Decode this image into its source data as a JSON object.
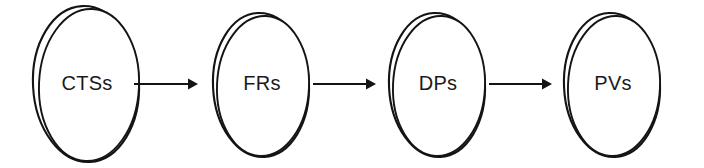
{
  "diagram": {
    "type": "flow-chain",
    "background_color": "#ffffff",
    "stroke_color": "#141414",
    "label_color": "#1a1a1a",
    "nodes": [
      {
        "id": "ctss",
        "label": "CTSs",
        "shape": "double-ellipse",
        "cx": 86,
        "cy": 84,
        "rx": 53,
        "ry": 78
      },
      {
        "id": "frs",
        "label": "FRs",
        "shape": "double-ellipse",
        "cx": 261,
        "cy": 85,
        "rx": 48,
        "ry": 72
      },
      {
        "id": "dps",
        "label": "DPs",
        "shape": "double-ellipse",
        "cx": 437,
        "cy": 85,
        "rx": 48,
        "ry": 72
      },
      {
        "id": "pvs",
        "label": "PVs",
        "shape": "double-ellipse",
        "cx": 612,
        "cy": 85,
        "rx": 48,
        "ry": 72
      }
    ],
    "edges": [
      {
        "id": "ctss-to-frs",
        "from": "ctss",
        "to": "frs",
        "x1": 134,
        "x2": 196,
        "y": 84
      },
      {
        "id": "frs-to-dps",
        "from": "frs",
        "to": "dps",
        "x1": 313,
        "x2": 374,
        "y": 84
      },
      {
        "id": "dps-to-pvs",
        "from": "dps",
        "to": "pvs",
        "x1": 489,
        "x2": 550,
        "y": 84
      }
    ]
  }
}
